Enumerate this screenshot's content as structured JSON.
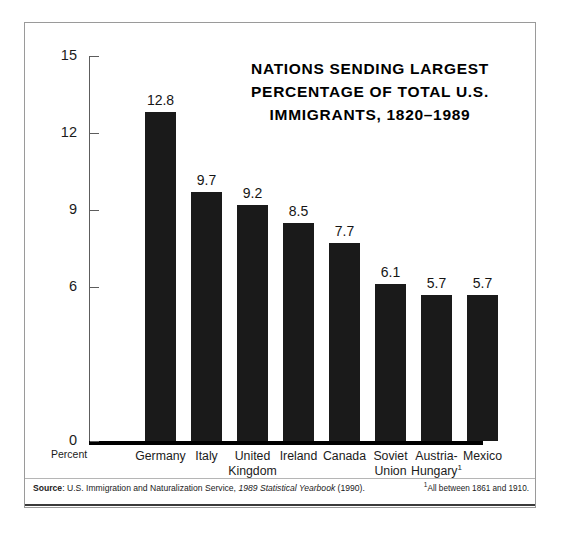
{
  "chart_data": {
    "type": "bar",
    "title_lines": [
      "NATIONS SENDING LARGEST",
      "PERCENTAGE OF TOTAL U.S.",
      "IMMIGRANTS, 1820–1989"
    ],
    "xlabel": "",
    "ylabel": "Percent",
    "ylim": [
      0,
      15
    ],
    "yticks": [
      15,
      12,
      9,
      6,
      0
    ],
    "ytick_labels": [
      "15",
      "12",
      "9",
      "6",
      "0"
    ],
    "grid": false,
    "legend": false,
    "bar_color": "#1a1a1a",
    "categories": [
      "Germany",
      "Italy",
      "United Kingdom",
      "Ireland",
      "Canada",
      "Soviet Union",
      "Austria-Hungary",
      "Mexico"
    ],
    "category_lines": [
      [
        "Germany"
      ],
      [
        "Italy"
      ],
      [
        "United",
        "Kingdom"
      ],
      [
        "Ireland"
      ],
      [
        "Canada"
      ],
      [
        "Soviet",
        "Union"
      ],
      [
        "Austria-",
        "Hungary"
      ],
      [
        "Mexico"
      ]
    ],
    "category_footnote_marks": [
      "",
      "",
      "",
      "",
      "",
      "",
      "1",
      ""
    ],
    "values": [
      12.8,
      9.7,
      9.2,
      8.5,
      7.7,
      6.1,
      5.7,
      5.7
    ],
    "value_labels": [
      "12.8",
      "9.7",
      "9.2",
      "8.5",
      "7.7",
      "6.1",
      "5.7",
      "5.7"
    ]
  },
  "footer": {
    "source_lead": "Source",
    "source_sep": ": ",
    "source_text_a": "U.S. Immigration and Naturalization Service, ",
    "source_italic": "1989 Statistical Yearbook",
    "source_text_b": " (1990).",
    "footnote_mark": "1",
    "footnote_text": "All between 1861 and 1910."
  }
}
